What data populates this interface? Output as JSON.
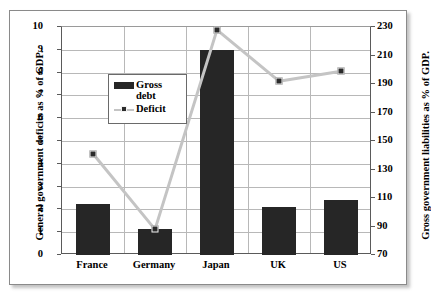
{
  "chart_data": {
    "type": "bar",
    "title": "",
    "subtitle": "",
    "categories": [
      "France",
      "Germany",
      "Japan",
      "UK",
      "US"
    ],
    "series": [
      {
        "name": "Gross debt",
        "type": "bar",
        "axis": "left",
        "values": [
          2.25,
          1.15,
          9.0,
          2.1,
          2.4
        ],
        "color": "#262626"
      },
      {
        "name": "Deficit",
        "type": "line",
        "axis": "right",
        "values": [
          141,
          88,
          228,
          192,
          199
        ],
        "color": "#c4c4c4",
        "marker_color": "#2b2b2b"
      }
    ],
    "xlabel": "",
    "ylabel": "General government deficits as % of GDP.",
    "ylabel_right": "Gross government liabilities as % of GDP.",
    "ylim": [
      0,
      10
    ],
    "ylim_right": [
      70,
      230
    ],
    "yticks": [
      "0",
      "1",
      "2",
      "3",
      "4",
      "5",
      "6",
      "7",
      "8",
      "9",
      "10"
    ],
    "yticks_right": [
      "70",
      "90",
      "110",
      "130",
      "150",
      "170",
      "190",
      "210",
      "230"
    ],
    "grid": true,
    "legend_position": "upper-left-inside"
  },
  "legend": {
    "items": [
      {
        "label_line1": "Gross",
        "label_line2": "debt",
        "key": "bar-swatch"
      },
      {
        "label_line1": "Deficit",
        "label_line2": "",
        "key": "line-swatch"
      }
    ]
  },
  "axes": {
    "left_title": "General government deficits as % of GDP.",
    "right_title": "Gross government liabilities as % of GDP."
  }
}
